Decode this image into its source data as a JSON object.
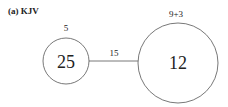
{
  "panel_label": "(a) KJV",
  "nodes": [
    {
      "id": "left",
      "value": "25",
      "top_label": "5",
      "cx": 66,
      "cy": 61,
      "r": 23
    },
    {
      "id": "right",
      "value": "12",
      "top_label": "9+3",
      "cx": 178,
      "cy": 63,
      "r": 40
    }
  ],
  "edges": [
    {
      "from": "left",
      "to": "right",
      "label": "15"
    }
  ],
  "colors": {
    "stroke": "#555555",
    "text": "#222222"
  }
}
